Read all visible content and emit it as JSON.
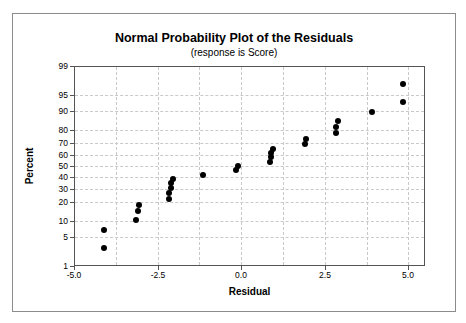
{
  "figure": {
    "title": "Normal Probability Plot of the Residuals",
    "subtitle": "(response is Score)"
  },
  "chart_data": {
    "type": "scatter",
    "title": "Normal Probability Plot of the Residuals",
    "subtitle": "(response is Score)",
    "xlabel": "Residual",
    "ylabel": "Percent",
    "xlim": [
      -5.0,
      5.5
    ],
    "x_ticks": [
      -5.0,
      -2.5,
      0.0,
      2.5,
      5.0
    ],
    "x_tick_labels": [
      "-5.0",
      "-2.5",
      "0.0",
      "2.5",
      "5.0"
    ],
    "x_minor_grid_step": 1.25,
    "y_scale": "normal-probability",
    "ylim": [
      1,
      99
    ],
    "y_ticks": [
      1,
      5,
      10,
      20,
      30,
      40,
      50,
      60,
      70,
      80,
      90,
      95,
      99
    ],
    "grid": "dashed",
    "legend": "none",
    "marker": {
      "shape": "circle",
      "size": 6,
      "color": "#000000"
    },
    "points": [
      [
        -4.1,
        2.8
      ],
      [
        -4.1,
        6.7
      ],
      [
        -3.15,
        10.6
      ],
      [
        -3.1,
        14.6
      ],
      [
        -3.05,
        18.5
      ],
      [
        -2.15,
        22.4
      ],
      [
        -2.15,
        26.4
      ],
      [
        -2.1,
        30.3
      ],
      [
        -2.1,
        34.3
      ],
      [
        -2.05,
        38.2
      ],
      [
        -1.15,
        42.1
      ],
      [
        -0.15,
        46.1
      ],
      [
        -0.1,
        50.0
      ],
      [
        0.85,
        53.9
      ],
      [
        0.9,
        57.9
      ],
      [
        0.9,
        61.8
      ],
      [
        0.95,
        65.7
      ],
      [
        1.9,
        69.7
      ],
      [
        1.95,
        73.6
      ],
      [
        2.85,
        77.6
      ],
      [
        2.85,
        81.5
      ],
      [
        2.9,
        85.4
      ],
      [
        3.9,
        89.4
      ],
      [
        4.85,
        93.3
      ],
      [
        4.85,
        97.2
      ]
    ]
  },
  "colors": {
    "marker": "#000000",
    "grid": "#c9c9c9",
    "plot_frame": "#545454",
    "figure_border": "#8c8c8c",
    "text": "#000000",
    "background": "#ffffff"
  }
}
